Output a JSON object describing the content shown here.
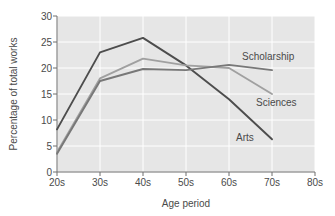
{
  "chart_data": {
    "type": "line",
    "title": "",
    "xlabel": "Age period",
    "ylabel": "Percentage of total works",
    "categories": [
      "20s",
      "30s",
      "40s",
      "50s",
      "60s",
      "70s"
    ],
    "x_tick_labels": [
      "20s",
      "30s",
      "40s",
      "50s",
      "60s",
      "70s",
      "80s"
    ],
    "y_tick_labels": [
      "0",
      "5",
      "10",
      "15",
      "20",
      "25",
      "30"
    ],
    "xlim": [
      "20s",
      "80s"
    ],
    "ylim": [
      0,
      30
    ],
    "y_tick_step": 5,
    "grid": "horizontal-and-vertical-white",
    "legend": "inline-labels-at-right",
    "plot_background": "#e6e6e6",
    "gridline_color": "#ffffff",
    "axis_color": "#6e6e6e",
    "series": [
      {
        "name": "Arts",
        "color": "#4d4d4d",
        "label_text": "Arts",
        "values": [
          8.2,
          23.0,
          25.8,
          20.5,
          14.0,
          6.3
        ]
      },
      {
        "name": "Sciences",
        "color": "#a0a0a0",
        "label_text": "Sciences",
        "values": [
          3.8,
          18.0,
          21.8,
          20.5,
          20.0,
          15.0
        ]
      },
      {
        "name": "Scholarship",
        "color": "#787878",
        "label_text": "Scholarship",
        "values": [
          3.5,
          17.5,
          19.8,
          19.6,
          20.6,
          19.6
        ]
      }
    ]
  },
  "labels": {
    "y_axis_title": "Percentage of total works",
    "x_axis_title": "Age period",
    "scholarship": "Scholarship",
    "sciences": "Sciences",
    "arts": "Arts",
    "y0": "0",
    "y5": "5",
    "y10": "10",
    "y15": "15",
    "y20": "20",
    "y25": "25",
    "y30": "30",
    "x20": "20s",
    "x30": "30s",
    "x40": "40s",
    "x50": "50s",
    "x60": "60s",
    "x70": "70s",
    "x80": "80s"
  }
}
